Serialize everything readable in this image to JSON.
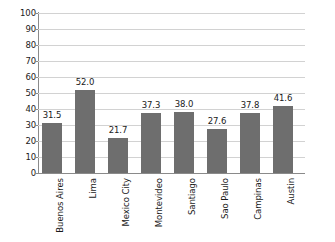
{
  "chart_data": {
    "type": "bar",
    "title": "",
    "xlabel": "",
    "ylabel": "",
    "categories": [
      "Buenos Aires",
      "Lima",
      "Mexico City",
      "Montevideo",
      "Santiago",
      "Sao Paulo",
      "Campinas",
      "Austin"
    ],
    "values": [
      31.5,
      52.0,
      21.7,
      37.3,
      38.0,
      27.6,
      37.8,
      41.6
    ],
    "value_labels": [
      "31.5",
      "52.0",
      "21.7",
      "37.3",
      "38.0",
      "27.6",
      "37.8",
      "41.6"
    ],
    "ylim": [
      0,
      100
    ],
    "ytick_step": 10,
    "yticks": [
      100,
      90,
      80,
      70,
      60,
      50,
      40,
      30,
      20,
      10,
      0
    ],
    "ytick_labels": [
      "100",
      "90",
      "80",
      "70",
      "60",
      "50",
      "40",
      "30",
      "20",
      "10",
      "0"
    ],
    "grid": true,
    "grid_axis": "y",
    "legend": false,
    "legend_position": "none",
    "bar_color": "#6e6e6e",
    "grid_color": "#d2d2d2",
    "axis_color": "#8a8a8a",
    "background_color": "#ffffff",
    "text_color": "#1a1a1a",
    "category_label_rotation": -90
  }
}
